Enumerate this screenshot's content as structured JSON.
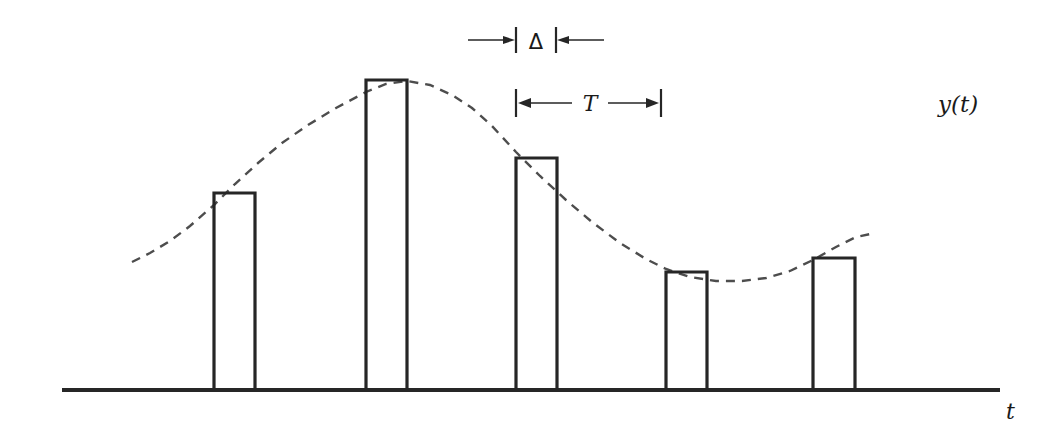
{
  "figure": {
    "background_color": "#ffffff",
    "ink_color": "#262626",
    "baseline_color": "#262626",
    "curve_color": "#4d4d4d",
    "width": 1057,
    "height": 438
  },
  "labels": {
    "signal": "y(t)",
    "time_axis": "t",
    "pulse_width": "Δ",
    "sampling_period": "T"
  },
  "annotations": {
    "delta": {
      "label": "Δ",
      "label_x": 535,
      "label_y": 48,
      "tick_left_x": 516,
      "tick_right_x": 556,
      "tick_top_y": 27,
      "tick_bottom_y": 53,
      "arrow_y": 40,
      "arrow_left_start_x": 468,
      "arrow_right_start_x": 604,
      "direction": "inward"
    },
    "period": {
      "label": "T",
      "label_x": 589,
      "label_y": 110,
      "tick_left_x": 516,
      "tick_right_x": 661,
      "tick_top_y": 89,
      "tick_bottom_y": 117,
      "arrow_y": 103,
      "direction": "outward"
    }
  },
  "axis": {
    "baseline_y": 390,
    "baseline_x_start": 62,
    "baseline_x_end": 1000,
    "baseline_thickness": 4,
    "t_label_x": 1006,
    "t_label_y": 418,
    "y_label_x": 938,
    "y_label_y": 112
  },
  "chart_data": {
    "type": "bar",
    "xlabel": "t",
    "ylabel": "y(t)",
    "grid": false,
    "legend": false,
    "axis_ranges": {
      "x_pixels": [
        62,
        1000
      ],
      "y_pixels": [
        390,
        60
      ]
    },
    "pulse_width_px": 41,
    "sampling_period_px": 145,
    "categories": [
      "sample 1",
      "sample 2",
      "sample 3",
      "sample 4",
      "sample 5"
    ],
    "values": [
      197,
      310,
      232,
      118,
      132
    ],
    "bars": [
      {
        "name": "sample 1",
        "x_left": 214,
        "x_right": 255,
        "top_y": 193,
        "height_px": 197
      },
      {
        "name": "sample 2",
        "x_left": 366,
        "x_right": 407,
        "top_y": 80,
        "height_px": 310
      },
      {
        "name": "sample 3",
        "x_left": 516,
        "x_right": 557,
        "top_y": 158,
        "height_px": 232
      },
      {
        "name": "sample 4",
        "x_left": 666,
        "x_right": 707,
        "top_y": 272,
        "height_px": 118
      },
      {
        "name": "sample 5",
        "x_left": 813,
        "x_right": 855,
        "top_y": 258,
        "height_px": 132
      }
    ],
    "series": [
      {
        "name": "y(t)",
        "style": "dashed",
        "points": [
          [
            132,
            262
          ],
          [
            150,
            253
          ],
          [
            170,
            241
          ],
          [
            190,
            226
          ],
          [
            214,
            205
          ],
          [
            235,
            184
          ],
          [
            258,
            163
          ],
          [
            282,
            143
          ],
          [
            308,
            125
          ],
          [
            336,
            108
          ],
          [
            366,
            92
          ],
          [
            386,
            84
          ],
          [
            407,
            81
          ],
          [
            430,
            85
          ],
          [
            452,
            95
          ],
          [
            472,
            108
          ],
          [
            492,
            126
          ],
          [
            516,
            152
          ],
          [
            540,
            176
          ],
          [
            566,
            200
          ],
          [
            592,
            222
          ],
          [
            620,
            243
          ],
          [
            646,
            259
          ],
          [
            666,
            269
          ],
          [
            690,
            277
          ],
          [
            716,
            281
          ],
          [
            742,
            281
          ],
          [
            766,
            278
          ],
          [
            790,
            271
          ],
          [
            813,
            260
          ],
          [
            836,
            247
          ],
          [
            856,
            237
          ],
          [
            875,
            233
          ]
        ]
      }
    ]
  }
}
